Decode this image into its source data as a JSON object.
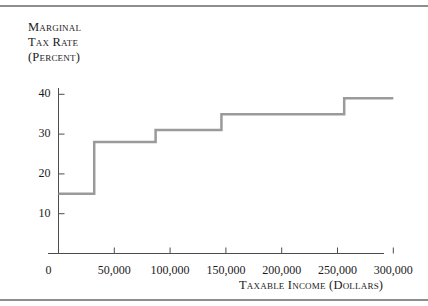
{
  "figure": {
    "background_color": "#ffffff",
    "rule_color": "#8e8e8e",
    "axis_color": "#4d4d4d",
    "text_color": "#1b1b1b"
  },
  "chart_data": {
    "type": "line",
    "subtype": "step",
    "title": "",
    "ylabel_lines": [
      "Marginal",
      "Tax Rate",
      "(Percent)"
    ],
    "ylabel": "Marginal Tax Rate (Percent)",
    "xlabel": "Taxable Income (Dollars)",
    "xlim": [
      0,
      300000
    ],
    "ylim": [
      0,
      45
    ],
    "grid": false,
    "legend": false,
    "line_color": "#9a9a9a",
    "line_width": 2.5,
    "y_ticks": [
      10,
      20,
      30,
      40
    ],
    "y_tick_labels": [
      "10",
      "20",
      "30",
      "40"
    ],
    "x_ticks": [
      50000,
      100000,
      150000,
      200000,
      250000,
      300000
    ],
    "x_tick_labels": [
      "50,000",
      "100,000",
      "150,000",
      "200,000",
      "250,000",
      "300,000"
    ],
    "origin_label": "0",
    "brackets": [
      {
        "x_start": 0,
        "x_end": 32000,
        "rate": 15
      },
      {
        "x_start": 32000,
        "x_end": 87000,
        "rate": 28
      },
      {
        "x_start": 87000,
        "x_end": 146000,
        "rate": 31
      },
      {
        "x_start": 146000,
        "x_end": 256000,
        "rate": 35
      },
      {
        "x_start": 256000,
        "x_end": 300000,
        "rate": 39
      }
    ],
    "x": [
      0,
      32000,
      32000,
      87000,
      87000,
      146000,
      146000,
      256000,
      256000,
      300000
    ],
    "y": [
      15,
      15,
      28,
      28,
      31,
      31,
      35,
      35,
      39,
      39
    ]
  }
}
